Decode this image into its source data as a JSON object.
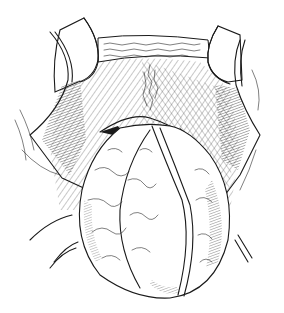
{
  "figure": {
    "type": "surgical-illustration",
    "style": "black-and-white line drawing",
    "colors": {
      "ink": "#1a1a1a",
      "background": "#ffffff"
    }
  }
}
